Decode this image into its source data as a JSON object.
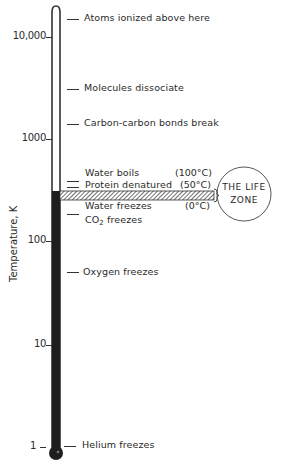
{
  "axis": {
    "title": "Temperature, K",
    "scale": "log",
    "ticks": [
      {
        "label": "10,000",
        "value": 10000,
        "y": 37
      },
      {
        "label": "1000",
        "value": 1000,
        "y": 139
      },
      {
        "label": "100",
        "value": 100,
        "y": 241
      },
      {
        "label": "10",
        "value": 10,
        "y": 345
      },
      {
        "label": "1",
        "value": 1,
        "y": 447
      }
    ]
  },
  "events": [
    {
      "label": "Atoms ionized above here",
      "y": 18
    },
    {
      "label": "Molecules dissociate",
      "y": 88
    },
    {
      "label": "Carbon-carbon bonds break",
      "y": 124
    },
    {
      "label": "Water boils",
      "y": 173,
      "celsius": "(100°C)"
    },
    {
      "label": "Protein denatured",
      "y": 185,
      "celsius": "(50°C)"
    },
    {
      "label": "Water freezes",
      "y": 206,
      "celsius": "(0°C)"
    },
    {
      "label": "CO",
      "sub": "2",
      "suffix": " freezes",
      "y": 221
    },
    {
      "label": "Oxygen freezes",
      "y": 273
    },
    {
      "label": "Helium freezes",
      "y": 446
    }
  ],
  "life_zone": {
    "line1": "THE LIFE",
    "line2": "ZONE"
  },
  "colors": {
    "ink": "#2a2a2a",
    "fill": "#1e1e1e",
    "background": "#ffffff"
  }
}
